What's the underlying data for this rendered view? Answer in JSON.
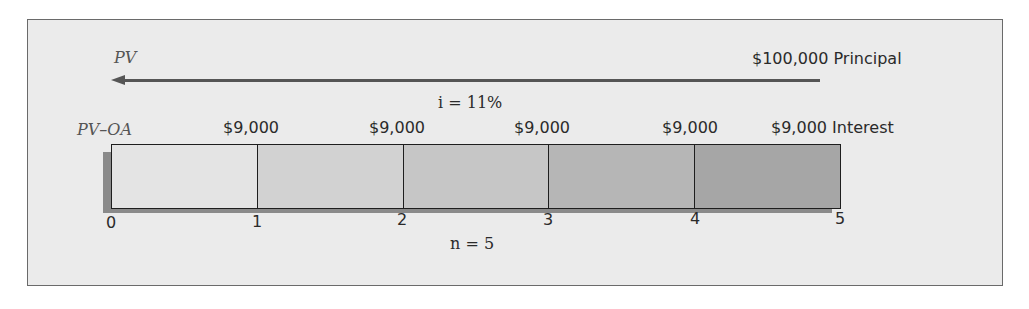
{
  "diagram": {
    "type": "time-line",
    "pv_label": "PV",
    "pv_oa_label": "PV–OA",
    "principal": {
      "amount": "$100,000",
      "label": "Principal"
    },
    "interest_rate": "i = 11%",
    "periods_label": "n = 5",
    "payments": [
      {
        "amount": "$9,000",
        "suffix": ""
      },
      {
        "amount": "$9,000",
        "suffix": ""
      },
      {
        "amount": "$9,000",
        "suffix": ""
      },
      {
        "amount": "$9,000",
        "suffix": ""
      },
      {
        "amount": "$9,000",
        "suffix": "Interest"
      }
    ],
    "period_ticks": [
      "0",
      "1",
      "2",
      "3",
      "4",
      "5"
    ],
    "segment_colors": [
      "#e4e4e4",
      "#d2d2d2",
      "#c6c6c6",
      "#b6b6b6",
      "#a6a6a6"
    ],
    "colors": {
      "background": "#ebebeb",
      "border": "#6a6a6a",
      "arrow": "#555555",
      "shadow": "#8a8a8a"
    }
  }
}
